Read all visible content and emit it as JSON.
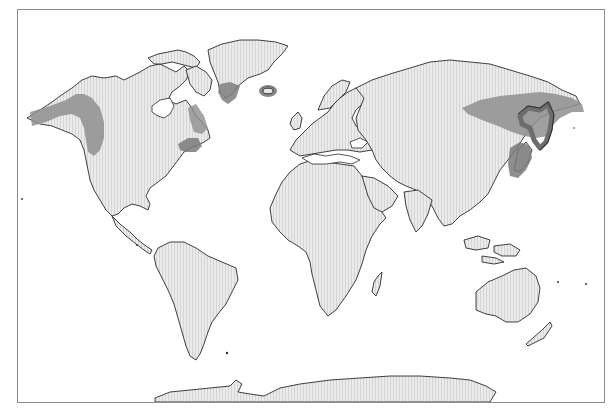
{
  "map": {
    "projection": "world",
    "colors": {
      "land_fill": "#e6e6e6",
      "land_hatch": "#d2d2d2",
      "coastline": "#2a2a2a",
      "shaded_region": "#8f8f8f",
      "shaded_region_dark": "#707070",
      "ocean": "#ffffff",
      "frame": "#8d8d8d"
    },
    "landmasses": [
      "north-america",
      "greenland",
      "south-america",
      "europe",
      "africa",
      "asia",
      "arabia",
      "india",
      "southeast-asia",
      "australia",
      "new-zealand",
      "madagascar",
      "japan",
      "antarctica",
      "iceland",
      "british-isles",
      "canadian-archipelago",
      "kamchatka"
    ],
    "shaded_regions": [
      {
        "id": "alaska-pacific-northwest",
        "label": "Alaska / Pacific Northwest coast"
      },
      {
        "id": "canada-east",
        "label": "Eastern Canada (Labrador / Quebec)"
      },
      {
        "id": "us-northeast",
        "label": "US Northeast / Nova Scotia"
      },
      {
        "id": "greenland-south",
        "label": "Southern Greenland"
      },
      {
        "id": "iceland",
        "label": "Iceland"
      },
      {
        "id": "siberia-east",
        "label": "Eastern Siberia"
      },
      {
        "id": "kamchatka-okhotsk",
        "label": "Sea of Okhotsk / Kamchatka"
      },
      {
        "id": "japan-korea",
        "label": "Japan / Korea coast"
      }
    ]
  }
}
